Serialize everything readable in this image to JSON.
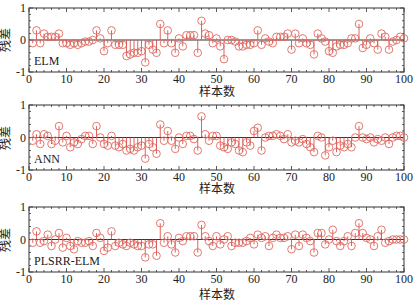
{
  "figure": {
    "colors": {
      "stem": "#d9534f",
      "marker": "#e06a60",
      "axis": "#333333",
      "baseline": "#333333"
    }
  },
  "chart_data": [
    {
      "type": "stem",
      "panel_label": "ELM",
      "title": "",
      "xlabel": "样本数",
      "ylabel": "残差",
      "xlim": [
        0,
        100
      ],
      "ylim": [
        -1,
        1
      ],
      "xticks": [
        0,
        10,
        20,
        30,
        40,
        50,
        60,
        70,
        80,
        90,
        100
      ],
      "yticks": [
        -1,
        0,
        1
      ],
      "grid": false,
      "x": [
        1,
        2,
        3,
        4,
        5,
        6,
        7,
        8,
        9,
        10,
        11,
        12,
        13,
        14,
        15,
        16,
        17,
        18,
        19,
        20,
        21,
        22,
        23,
        24,
        25,
        26,
        27,
        28,
        29,
        30,
        31,
        32,
        33,
        34,
        35,
        36,
        37,
        38,
        39,
        40,
        41,
        42,
        43,
        44,
        45,
        46,
        47,
        48,
        49,
        50,
        51,
        52,
        53,
        54,
        55,
        56,
        57,
        58,
        59,
        60,
        61,
        62,
        63,
        64,
        65,
        66,
        67,
        68,
        69,
        70,
        71,
        72,
        73,
        74,
        75,
        76,
        77,
        78,
        79,
        80,
        81,
        82,
        83,
        84,
        85,
        86,
        87,
        88,
        89,
        90,
        91,
        92,
        93,
        94,
        95,
        96,
        97,
        98,
        99,
        100
      ],
      "values": [
        -0.1,
        0.3,
        -0.1,
        0.2,
        0.1,
        0.1,
        0.1,
        0.2,
        -0.1,
        -0.1,
        -0.15,
        -0.1,
        -0.15,
        -0.1,
        -0.05,
        -0.05,
        0.0,
        0.3,
        0.05,
        -0.35,
        -0.1,
        0.3,
        -0.15,
        -0.15,
        -0.15,
        -0.5,
        -0.45,
        -0.4,
        -0.4,
        -0.35,
        -0.7,
        -0.15,
        -0.3,
        -0.4,
        0.5,
        -0.1,
        0.3,
        -0.1,
        -0.4,
        0.05,
        -0.2,
        0.15,
        0.15,
        0.15,
        -0.4,
        0.6,
        0.2,
        0.15,
        -0.1,
        0.05,
        -0.2,
        -0.6,
        0.0,
        0.0,
        -0.05,
        -0.2,
        -0.2,
        -0.15,
        -0.15,
        -0.1,
        0.3,
        -0.15,
        0.05,
        -0.05,
        -0.1,
        0.1,
        0.1,
        0.1,
        0.2,
        -0.3,
        0.2,
        -0.1,
        0.05,
        -0.1,
        -0.15,
        -0.45,
        0.2,
        0.05,
        -0.05,
        -0.35,
        -0.4,
        -0.2,
        -0.15,
        -0.15,
        -0.1,
        0.05,
        0.05,
        0.5,
        -0.25,
        -0.15,
        0.05,
        -0.1,
        -0.3,
        0.2,
        0.1,
        -0.3,
        -0.05,
        0.0,
        0.1,
        0.05
      ]
    },
    {
      "type": "stem",
      "panel_label": "ANN",
      "title": "",
      "xlabel": "样本数",
      "ylabel": "残差",
      "xlim": [
        0,
        100
      ],
      "ylim": [
        -1,
        1
      ],
      "xticks": [
        0,
        10,
        20,
        30,
        40,
        50,
        60,
        70,
        80,
        90,
        100
      ],
      "yticks": [
        -1,
        0,
        1
      ],
      "grid": false,
      "x": [
        1,
        2,
        3,
        4,
        5,
        6,
        7,
        8,
        9,
        10,
        11,
        12,
        13,
        14,
        15,
        16,
        17,
        18,
        19,
        20,
        21,
        22,
        23,
        24,
        25,
        26,
        27,
        28,
        29,
        30,
        31,
        32,
        33,
        34,
        35,
        36,
        37,
        38,
        39,
        40,
        41,
        42,
        43,
        44,
        45,
        46,
        47,
        48,
        49,
        50,
        51,
        52,
        53,
        54,
        55,
        56,
        57,
        58,
        59,
        60,
        61,
        62,
        63,
        64,
        65,
        66,
        67,
        68,
        69,
        70,
        71,
        72,
        73,
        74,
        75,
        76,
        77,
        78,
        79,
        80,
        81,
        82,
        83,
        84,
        85,
        86,
        87,
        88,
        89,
        90,
        91,
        92,
        93,
        94,
        95,
        96,
        97,
        98,
        99,
        100
      ],
      "values": [
        -0.1,
        0.1,
        -0.2,
        0.1,
        0.05,
        -0.2,
        -0.1,
        0.35,
        -0.15,
        0.05,
        -0.3,
        -0.15,
        -0.2,
        -0.05,
        0.05,
        0.05,
        -0.2,
        0.35,
        0.0,
        -0.2,
        -0.25,
        0.05,
        -0.25,
        -0.3,
        -0.2,
        -0.4,
        -0.35,
        -0.4,
        -0.3,
        -0.25,
        -0.65,
        -0.2,
        -0.3,
        -0.5,
        0.4,
        -0.1,
        0.2,
        -0.1,
        -0.35,
        0.0,
        -0.2,
        0.05,
        0.05,
        -0.05,
        -0.4,
        0.65,
        0.1,
        -0.1,
        0.05,
        0.05,
        -0.25,
        -0.3,
        -0.35,
        -0.15,
        -0.2,
        -0.4,
        -0.45,
        -0.15,
        -0.25,
        0.2,
        0.3,
        -0.4,
        0.0,
        0.05,
        0.05,
        0.1,
        0.05,
        -0.05,
        0.1,
        -0.15,
        -0.1,
        -0.15,
        -0.05,
        -0.2,
        -0.3,
        -0.45,
        0.05,
        0.0,
        -0.55,
        -0.3,
        -0.1,
        -0.45,
        -0.25,
        -0.3,
        -0.2,
        -0.3,
        0.0,
        0.35,
        0.0,
        -0.05,
        0.0,
        -0.15,
        -0.05,
        -0.1,
        0.0,
        -0.2,
        0.0,
        0.05,
        0.05,
        0.0
      ]
    },
    {
      "type": "stem",
      "panel_label": "PLSRR-ELM",
      "title": "",
      "xlabel": "样本数",
      "ylabel": "残差",
      "xlim": [
        0,
        100
      ],
      "ylim": [
        -1,
        1
      ],
      "xticks": [
        0,
        10,
        20,
        30,
        40,
        50,
        60,
        70,
        80,
        90,
        100
      ],
      "yticks": [
        -1,
        0,
        1
      ],
      "grid": false,
      "x": [
        1,
        2,
        3,
        4,
        5,
        6,
        7,
        8,
        9,
        10,
        11,
        12,
        13,
        14,
        15,
        16,
        17,
        18,
        19,
        20,
        21,
        22,
        23,
        24,
        25,
        26,
        27,
        28,
        29,
        30,
        31,
        32,
        33,
        34,
        35,
        36,
        37,
        38,
        39,
        40,
        41,
        42,
        43,
        44,
        45,
        46,
        47,
        48,
        49,
        50,
        51,
        52,
        53,
        54,
        55,
        56,
        57,
        58,
        59,
        60,
        61,
        62,
        63,
        64,
        65,
        66,
        67,
        68,
        69,
        70,
        71,
        72,
        73,
        74,
        75,
        76,
        77,
        78,
        79,
        80,
        81,
        82,
        83,
        84,
        85,
        86,
        87,
        88,
        89,
        90,
        91,
        92,
        93,
        94,
        95,
        96,
        97,
        98,
        99,
        100
      ],
      "values": [
        -0.1,
        0.25,
        -0.1,
        -0.05,
        0.15,
        -0.2,
        0.0,
        0.2,
        -0.25,
        0.05,
        -0.2,
        -0.3,
        -0.05,
        -0.1,
        -0.1,
        -0.05,
        -0.2,
        0.2,
        0.05,
        -0.35,
        -0.25,
        0.25,
        -0.2,
        -0.1,
        -0.15,
        -0.2,
        -0.1,
        -0.15,
        -0.2,
        -0.2,
        -0.55,
        -0.15,
        -0.15,
        -0.5,
        0.5,
        -0.1,
        0.1,
        -0.15,
        -0.4,
        0.05,
        -0.05,
        0.1,
        0.1,
        0.1,
        -0.4,
        0.45,
        0.1,
        -0.05,
        -0.2,
        0.1,
        -0.15,
        0.0,
        0.1,
        -0.2,
        -0.1,
        -0.1,
        -0.1,
        -0.05,
        0.05,
        -0.15,
        0.15,
        0.05,
        0.1,
        -0.2,
        0.05,
        0.15,
        0.05,
        0.05,
        0.1,
        -0.3,
        0.15,
        -0.2,
        0.15,
        0.05,
        -0.05,
        -0.4,
        0.2,
        0.2,
        -0.15,
        0.0,
        0.3,
        -0.05,
        -0.2,
        -0.05,
        0.1,
        -0.2,
        0.2,
        0.5,
        0.2,
        0.05,
        0.0,
        -0.2,
        0.1,
        0.3,
        -0.1,
        -0.05,
        0.0,
        0.0,
        0.0,
        0.0
      ]
    }
  ]
}
